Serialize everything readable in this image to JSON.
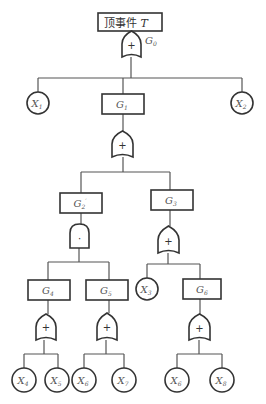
{
  "diagram": {
    "type": "fault-tree",
    "top_event": {
      "label": "顶事件",
      "var": "T"
    },
    "gate_labels": {
      "g0": "G",
      "g0_sub": "0"
    },
    "symbols": {
      "or": "+",
      "and": "·"
    },
    "events": {
      "g1": {
        "var": "G",
        "sub": "1"
      },
      "g2": {
        "var": "G",
        "sub": "2",
        "mark": "′"
      },
      "g3": {
        "var": "G",
        "sub": "3"
      },
      "g4": {
        "var": "G",
        "sub": "4"
      },
      "g5": {
        "var": "G",
        "sub": "5"
      },
      "g6": {
        "var": "G",
        "sub": "6"
      }
    },
    "basic_events": {
      "x1": {
        "var": "X",
        "sub": "1"
      },
      "x2": {
        "var": "X",
        "sub": "2"
      },
      "x3": {
        "var": "X",
        "sub": "3"
      },
      "x4": {
        "var": "X",
        "sub": "4"
      },
      "x5": {
        "var": "X",
        "sub": "5"
      },
      "x6a": {
        "var": "X",
        "sub": "6"
      },
      "x7": {
        "var": "X",
        "sub": "7"
      },
      "x6b": {
        "var": "X",
        "sub": "6"
      },
      "x8": {
        "var": "X",
        "sub": "8"
      }
    },
    "structure": {
      "T": {
        "gate": "OR",
        "gate_name": "G0",
        "children": [
          "X1",
          "G1",
          "X2"
        ]
      },
      "G1": {
        "gate": "OR",
        "children": [
          "G2'",
          "G3"
        ]
      },
      "G2'": {
        "gate": "AND",
        "children": [
          "G4",
          "G5"
        ]
      },
      "G3": {
        "gate": "OR",
        "children": [
          "X3",
          "G6"
        ]
      },
      "G4": {
        "gate": "OR",
        "children": [
          "X4",
          "X5"
        ]
      },
      "G5": {
        "gate": "OR",
        "children": [
          "X6",
          "X7"
        ]
      },
      "G6": {
        "gate": "OR",
        "children": [
          "X6",
          "X8"
        ]
      }
    }
  }
}
